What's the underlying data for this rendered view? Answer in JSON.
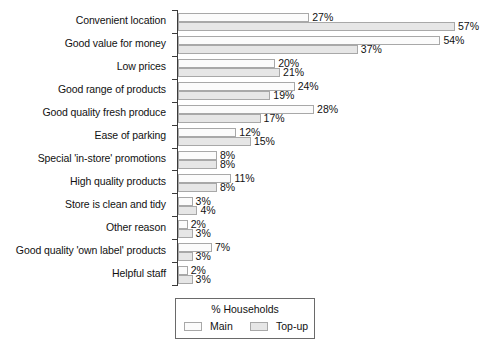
{
  "chart_data": {
    "type": "bar",
    "orientation": "horizontal",
    "title": "",
    "subtitle": "",
    "xlabel": "",
    "ylabel": "",
    "xlim": [
      0,
      60
    ],
    "grid": false,
    "legend_position": "bottom",
    "legend_title": "% Households",
    "value_suffix": "%",
    "categories": [
      "Convenient location",
      "Good value for money",
      "Low prices",
      "Good range of products",
      "Good quality fresh produce",
      "Ease of parking",
      "Special 'in-store' promotions",
      "High quality products",
      "Store is clean and tidy",
      "Other reason",
      "Good quality 'own label' products",
      "Helpful staff"
    ],
    "series": [
      {
        "name": "Main",
        "color": "#fbfbfb",
        "values": [
          27,
          54,
          20,
          24,
          28,
          12,
          8,
          11,
          3,
          2,
          7,
          2
        ],
        "labels": [
          "27%",
          "54%",
          "20%",
          "24%",
          "28%",
          "12%",
          "8%",
          "11%",
          "3%",
          "2%",
          "7%",
          "2%"
        ]
      },
      {
        "name": "Top-up",
        "color": "#e6e6e6",
        "values": [
          57,
          37,
          21,
          19,
          17,
          15,
          8,
          8,
          4,
          3,
          3,
          3
        ],
        "labels": [
          "57%",
          "37%",
          "21%",
          "19%",
          "17%",
          "15%",
          "8%",
          "8%",
          "4%",
          "3%",
          "3%",
          "3%"
        ]
      }
    ]
  },
  "legend": {
    "title": "% Households",
    "entries": [
      {
        "label": "Main",
        "swatch": "main"
      },
      {
        "label": "Top-up",
        "swatch": "topup"
      }
    ]
  }
}
